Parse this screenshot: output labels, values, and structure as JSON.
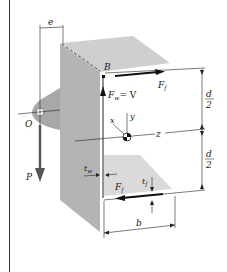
{
  "figure": {
    "labels": {
      "e": "e",
      "B": "B",
      "Ff_top": "F",
      "Ff_top_sub": "f",
      "Fw": "F",
      "Fw_sub": "w",
      "Fw_eq": "= V",
      "O": "O",
      "P": "P",
      "x": "x",
      "y": "y",
      "z": "z",
      "tw": "t",
      "tw_sub": "w",
      "Ff_bottom": "F",
      "Ff_bottom_sub": "f",
      "tf": "t",
      "tf_sub": "f",
      "b": "b",
      "d_top_num": "d",
      "d_top_den": "2",
      "d_bot_num": "d",
      "d_bot_den": "2"
    },
    "colors": {
      "web_face": "#b4b4b4",
      "flange_face": "#cfcfcf",
      "bracket": "#a8a8a8",
      "arrow_P": "#555555",
      "line": "#1a1a1a",
      "frame": "#333333"
    }
  }
}
